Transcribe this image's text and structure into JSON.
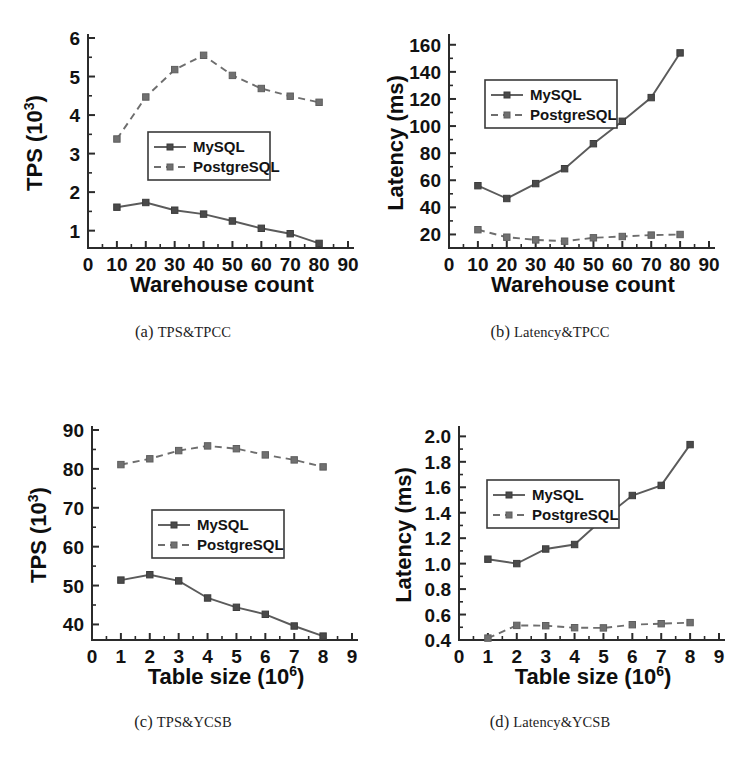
{
  "figure": {
    "background_color": "#ffffff",
    "panel_count": 4
  },
  "series_colors": {
    "mysql": "#4a4a4a",
    "postgresql": "#707070"
  },
  "legend": {
    "mysql_label": "MySQL",
    "postgresql_label": "PostgreSQL"
  },
  "panels": [
    {
      "id": "a",
      "caption_tag": "(a)",
      "caption_text": "TPS&TPCC"
    },
    {
      "id": "b",
      "caption_tag": "(b)",
      "caption_text": "Latency&TPCC"
    },
    {
      "id": "c",
      "caption_tag": "(c)",
      "caption_text": "TPS&YCSB"
    },
    {
      "id": "d",
      "caption_tag": "(d)",
      "caption_text": "Latency&YCSB"
    }
  ],
  "chart_data": [
    {
      "panel": "a",
      "type": "line",
      "title": "TPS&TPCC",
      "xlabel": "Warehouse count",
      "ylabel": "TPS (10^3)",
      "ylabel_base": "TPS (10",
      "ylabel_sup": "3",
      "ylabel_tail": ")",
      "x": [
        10,
        20,
        30,
        40,
        50,
        60,
        70,
        80
      ],
      "xlim": [
        0,
        90
      ],
      "ylim": [
        0.55,
        6
      ],
      "xticks": [
        0,
        10,
        20,
        30,
        40,
        50,
        60,
        70,
        80,
        90
      ],
      "xticklabels": [
        "0",
        "10",
        "20",
        "30",
        "40",
        "50",
        "60",
        "70",
        "80",
        "90"
      ],
      "yticks": [
        1,
        2,
        3,
        4,
        5,
        6
      ],
      "yticklabels": [
        "1",
        "2",
        "3",
        "4",
        "5",
        "6"
      ],
      "grid": false,
      "legend_position": "center",
      "series": [
        {
          "name": "MySQL",
          "style": "solid",
          "values": [
            1.61,
            1.73,
            1.53,
            1.43,
            1.25,
            1.06,
            0.92,
            0.67
          ]
        },
        {
          "name": "PostgreSQL",
          "style": "dashed",
          "values": [
            3.38,
            4.47,
            5.18,
            5.55,
            5.03,
            4.69,
            4.49,
            4.33
          ]
        }
      ]
    },
    {
      "panel": "b",
      "type": "line",
      "title": "Latency&TPCC",
      "xlabel": "Warehouse count",
      "ylabel": "Latency (ms)",
      "x": [
        10,
        20,
        30,
        40,
        50,
        60,
        70,
        80
      ],
      "xlim": [
        0,
        90
      ],
      "ylim": [
        10,
        165
      ],
      "xticks": [
        0,
        10,
        20,
        30,
        40,
        50,
        60,
        70,
        80,
        90
      ],
      "xticklabels": [
        "0",
        "10",
        "20",
        "30",
        "40",
        "50",
        "60",
        "70",
        "80",
        "90"
      ],
      "yticks": [
        20,
        40,
        60,
        80,
        100,
        120,
        140,
        160
      ],
      "yticklabels": [
        "20",
        "40",
        "60",
        "80",
        "100",
        "120",
        "140",
        "160"
      ],
      "grid": false,
      "legend_position": "upper-left",
      "series": [
        {
          "name": "MySQL",
          "style": "solid",
          "values": [
            56,
            46.5,
            57.5,
            68.5,
            87,
            103.5,
            121,
            154
          ]
        },
        {
          "name": "PostgreSQL",
          "style": "dashed",
          "values": [
            23.5,
            18,
            16,
            15,
            17.5,
            18.5,
            19.5,
            20
          ]
        }
      ]
    },
    {
      "panel": "c",
      "type": "line",
      "title": "TPS&YCSB",
      "xlabel": "Table size (10^6)",
      "xlabel_base": "Table size (10",
      "xlabel_sup": "6",
      "xlabel_tail": ")",
      "ylabel": "TPS (10^3)",
      "ylabel_base": "TPS (10",
      "ylabel_sup": "3",
      "ylabel_tail": ")",
      "x": [
        1,
        2,
        3,
        4,
        5,
        6,
        7,
        8
      ],
      "xlim": [
        0,
        9
      ],
      "ylim": [
        36,
        90
      ],
      "xticks": [
        0,
        1,
        2,
        3,
        4,
        5,
        6,
        7,
        8,
        9
      ],
      "xticklabels": [
        "0",
        "1",
        "2",
        "3",
        "4",
        "5",
        "6",
        "7",
        "8",
        "9"
      ],
      "yticks": [
        40,
        50,
        60,
        70,
        80,
        90
      ],
      "yticklabels": [
        "40",
        "50",
        "60",
        "70",
        "80",
        "90"
      ],
      "grid": false,
      "legend_position": "center",
      "series": [
        {
          "name": "MySQL",
          "style": "solid",
          "values": [
            51.4,
            52.8,
            51.2,
            46.8,
            44.4,
            42.6,
            39.6,
            37.0
          ]
        },
        {
          "name": "PostgreSQL",
          "style": "dashed",
          "values": [
            81.1,
            82.6,
            84.7,
            85.9,
            85.2,
            83.6,
            82.3,
            80.5
          ]
        }
      ]
    },
    {
      "panel": "d",
      "type": "line",
      "title": "Latency&YCSB",
      "xlabel": "Table size (10^6)",
      "xlabel_base": "Table size (10",
      "xlabel_sup": "6",
      "xlabel_tail": ")",
      "ylabel": "Latency (ms)",
      "x": [
        1,
        2,
        3,
        4,
        5,
        6,
        7,
        8
      ],
      "xlim": [
        0,
        9
      ],
      "ylim": [
        0.4,
        2.05
      ],
      "xticks": [
        0,
        1,
        2,
        3,
        4,
        5,
        6,
        7,
        8,
        9
      ],
      "xticklabels": [
        "0",
        "1",
        "2",
        "3",
        "4",
        "5",
        "6",
        "7",
        "8",
        "9"
      ],
      "yticks": [
        0.4,
        0.6,
        0.8,
        1.0,
        1.2,
        1.4,
        1.6,
        1.8,
        2.0
      ],
      "yticklabels": [
        "0.4",
        "0.6",
        "0.8",
        "1.0",
        "1.2",
        "1.4",
        "1.6",
        "1.8",
        "2.0"
      ],
      "grid": false,
      "legend_position": "upper-left",
      "series": [
        {
          "name": "MySQL",
          "style": "solid",
          "values": [
            1.035,
            1.0,
            1.115,
            1.15,
            1.355,
            1.535,
            1.615,
            1.935
          ]
        },
        {
          "name": "PostgreSQL",
          "style": "dashed",
          "values": [
            0.415,
            0.515,
            0.512,
            0.497,
            0.495,
            0.52,
            0.528,
            0.537
          ]
        }
      ]
    }
  ]
}
